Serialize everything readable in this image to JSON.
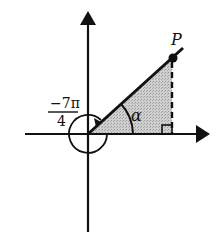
{
  "diagram": {
    "type": "coordinate-angle",
    "labels": {
      "point": "P",
      "angle_alpha": "α",
      "angle_numerator": "−7π",
      "angle_denominator": "4"
    },
    "colors": {
      "ink": "#111111",
      "shade": "#bdbdbd",
      "background": "#ffffff"
    }
  }
}
